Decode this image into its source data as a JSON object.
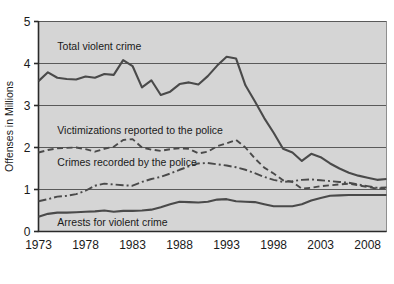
{
  "chart_data": {
    "type": "line",
    "title": "",
    "xlabel": "",
    "ylabel": "Offenses in Millions",
    "xlim": [
      1973,
      2010
    ],
    "ylim": [
      0,
      5
    ],
    "grid": true,
    "legend_position": "inline-labels",
    "xticks": [
      "1973",
      "1978",
      "1983",
      "1988",
      "1993",
      "1998",
      "2003",
      "2008"
    ],
    "xtick_values": [
      1973,
      1978,
      1983,
      1988,
      1993,
      1998,
      2003,
      2008
    ],
    "yticks": [
      "0",
      "1",
      "2",
      "3",
      "4",
      "5"
    ],
    "ytick_values": [
      0,
      1,
      2,
      3,
      4,
      5
    ],
    "x": [
      1973,
      1974,
      1975,
      1976,
      1977,
      1978,
      1979,
      1980,
      1981,
      1982,
      1983,
      1984,
      1985,
      1986,
      1987,
      1988,
      1989,
      1990,
      1991,
      1992,
      1993,
      1994,
      1995,
      1996,
      1997,
      1998,
      1999,
      2000,
      2001,
      2002,
      2003,
      2004,
      2005,
      2006,
      2007,
      2008,
      2009,
      2010
    ],
    "series": [
      {
        "name": "Total violent crime",
        "style": "solid",
        "color": "#4a4a4a",
        "label_x": 1975,
        "label_y": 4.42,
        "values": [
          3.58,
          3.79,
          3.66,
          3.63,
          3.62,
          3.69,
          3.66,
          3.75,
          3.73,
          4.08,
          3.94,
          3.43,
          3.6,
          3.25,
          3.33,
          3.51,
          3.55,
          3.5,
          3.7,
          3.95,
          4.16,
          4.12,
          3.48,
          3.1,
          2.7,
          2.35,
          1.97,
          1.88,
          1.68,
          1.85,
          1.77,
          1.62,
          1.5,
          1.4,
          1.33,
          1.28,
          1.23,
          1.25
        ]
      },
      {
        "name": "Victimizations reported to the police",
        "style": "dashed",
        "color": "#4a4a4a",
        "label_x": 1975,
        "label_y": 2.42,
        "values": [
          1.88,
          1.94,
          1.98,
          1.99,
          2.0,
          1.96,
          1.9,
          1.97,
          2.02,
          2.18,
          2.2,
          2.0,
          1.95,
          1.92,
          1.96,
          1.98,
          1.97,
          1.86,
          1.9,
          2.03,
          2.1,
          2.18,
          2.0,
          1.74,
          1.52,
          1.38,
          1.22,
          1.18,
          1.02,
          1.04,
          1.08,
          1.1,
          1.12,
          1.14,
          1.1,
          1.06,
          1.02,
          1.03
        ]
      },
      {
        "name": "Crimes recorded by the police",
        "style": "dashdot",
        "color": "#4a4a4a",
        "label_x": 1975,
        "label_y": 1.66,
        "values": [
          0.72,
          0.77,
          0.83,
          0.85,
          0.89,
          0.97,
          1.09,
          1.14,
          1.12,
          1.1,
          1.09,
          1.18,
          1.25,
          1.3,
          1.38,
          1.47,
          1.55,
          1.62,
          1.63,
          1.6,
          1.57,
          1.53,
          1.47,
          1.39,
          1.3,
          1.23,
          1.18,
          1.2,
          1.23,
          1.24,
          1.22,
          1.2,
          1.18,
          1.16,
          1.12,
          1.08,
          1.04,
          1.05
        ]
      },
      {
        "name": "Arrests for violent crime",
        "style": "solid",
        "color": "#4a4a4a",
        "label_x": 1975,
        "label_y": 0.22,
        "values": [
          0.35,
          0.42,
          0.45,
          0.45,
          0.46,
          0.47,
          0.48,
          0.5,
          0.47,
          0.49,
          0.49,
          0.5,
          0.52,
          0.58,
          0.65,
          0.71,
          0.7,
          0.69,
          0.71,
          0.76,
          0.77,
          0.72,
          0.71,
          0.7,
          0.65,
          0.6,
          0.6,
          0.6,
          0.65,
          0.74,
          0.8,
          0.85,
          0.86,
          0.87,
          0.87,
          0.87,
          0.87,
          0.87
        ]
      }
    ]
  },
  "axes": {
    "y_title": "Offenses in Millions"
  }
}
